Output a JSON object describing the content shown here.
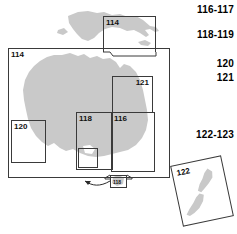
{
  "figure": {
    "type": "map-index-key",
    "region_names": [
      "Papua New Guinea",
      "Australia",
      "New Zealand"
    ],
    "land_fill_color": "#c9c9c9",
    "box_line_color": "#3a3a3a",
    "background_color": "#ffffff"
  },
  "legend": {
    "entries": [
      {
        "label": "116-117"
      },
      {
        "label": "118-119"
      },
      {
        "label": "120"
      },
      {
        "label": "121"
      },
      {
        "label": "122-123"
      }
    ]
  },
  "index_boxes": [
    {
      "id": "box-114-png",
      "label": "114",
      "region": "Papua New Guinea"
    },
    {
      "id": "box-114-main",
      "label": "114",
      "region": "Australia"
    },
    {
      "id": "box-120",
      "label": "120",
      "region": "Western Australia"
    },
    {
      "id": "box-121",
      "label": "121",
      "region": "Queensland"
    },
    {
      "id": "box-118",
      "label": "118",
      "region": "South East Australia"
    },
    {
      "id": "box-116",
      "label": "116",
      "region": "New South Wales"
    },
    {
      "id": "box-tas-118",
      "label": "118",
      "region": "Tasmania inset"
    },
    {
      "id": "box-122",
      "label": "122",
      "region": "New Zealand"
    }
  ]
}
